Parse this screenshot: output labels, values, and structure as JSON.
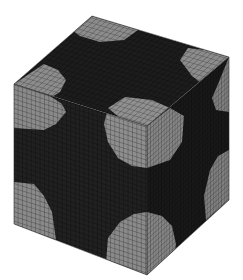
{
  "figure": {
    "title": "",
    "colors": {
      "background": "#ffffff",
      "dark_material": "#1e1e1e",
      "light_material": "#8a8a8a",
      "grid_line_dark": "#0a0a0a",
      "grid_line_light": "#3c3c3c"
    },
    "cube": {
      "vertices": {
        "top_back": [
          92,
          16
        ],
        "top_right": [
          229,
          57
        ],
        "top_left": [
          14,
          84
        ],
        "top_front": [
          147,
          126
        ],
        "bottom_left": [
          14,
          224
        ],
        "bottom_front": [
          147,
          275
        ],
        "bottom_right": [
          229,
          200
        ]
      },
      "mesh_divisions": 30
    }
  }
}
